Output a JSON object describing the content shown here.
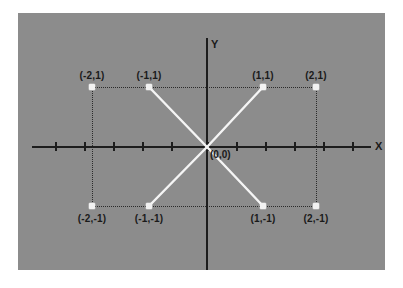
{
  "figure": {
    "background_color": "#ffffff",
    "panel_color": "#8c8c8c",
    "axis_color": "#1d1d1d",
    "point_color": "#f2f2f2",
    "line_color": "#f5f5f5",
    "guide_color": "#2b2b2b"
  },
  "axes": {
    "x_label": "X",
    "y_label": "Y",
    "origin_label": "(0,0)",
    "x_tick_count": 11,
    "x_axis_visible": true,
    "y_axis_visible": true,
    "grid": false
  },
  "chart_data": {
    "type": "scatter",
    "title": "",
    "xlabel": "X",
    "ylabel": "Y",
    "xlim": [
      -3,
      3
    ],
    "ylim": [
      -2.2,
      2.2
    ],
    "grid": false,
    "legend": "none",
    "points": [
      {
        "label": "(-2,1)",
        "x": -2,
        "y": 1,
        "px": 74,
        "py": 74,
        "label_px": 74,
        "label_py": 57,
        "label_pos": "above"
      },
      {
        "label": "(-1,1)",
        "x": -1,
        "y": 1,
        "px": 131,
        "py": 74,
        "label_px": 131,
        "label_py": 57,
        "label_pos": "above"
      },
      {
        "label": "(1,1)",
        "x": 1,
        "y": 1,
        "px": 245,
        "py": 74,
        "label_px": 245,
        "label_py": 57,
        "label_pos": "above"
      },
      {
        "label": "(2,1)",
        "x": 2,
        "y": 1,
        "px": 298,
        "py": 74,
        "label_px": 298,
        "label_py": 57,
        "label_pos": "above"
      },
      {
        "label": "(-2,-1)",
        "x": -2,
        "y": -1,
        "px": 74,
        "py": 193,
        "label_px": 74,
        "label_py": 200,
        "label_pos": "below"
      },
      {
        "label": "(-1,-1)",
        "x": -1,
        "y": -1,
        "px": 131,
        "py": 193,
        "label_px": 131,
        "label_py": 200,
        "label_pos": "below"
      },
      {
        "label": "(1,-1)",
        "x": 1,
        "y": -1,
        "px": 245,
        "py": 193,
        "label_px": 245,
        "label_py": 200,
        "label_pos": "below"
      },
      {
        "label": "(2,-1)",
        "x": 2,
        "y": -1,
        "px": 298,
        "py": 193,
        "label_px": 298,
        "label_py": 200,
        "label_pos": "below"
      }
    ],
    "segments": [
      {
        "name": "upper-left-to-origin",
        "from": "(-1,1)",
        "to": "(0,0)",
        "x1": 131,
        "y1": 74,
        "x2": 189,
        "y2": 134
      },
      {
        "name": "origin-to-lower-right",
        "from": "(0,0)",
        "to": "(1,-1)",
        "x1": 189,
        "y1": 134,
        "x2": 245,
        "y2": 193
      },
      {
        "name": "lower-left-to-origin",
        "from": "(-1,-1)",
        "to": "(0,0)",
        "x1": 131,
        "y1": 193,
        "x2": 189,
        "y2": 134
      },
      {
        "name": "origin-to-upper-right",
        "from": "(0,0)",
        "to": "(1,1)",
        "x1": 189,
        "y1": 134,
        "x2": 245,
        "y2": 74
      }
    ],
    "guides": [
      {
        "name": "guide-top",
        "orientation": "horizontal",
        "from": "(-2,1)",
        "to": "(2,1)"
      },
      {
        "name": "guide-bottom",
        "orientation": "horizontal",
        "from": "(-2,-1)",
        "to": "(2,-1)"
      },
      {
        "name": "guide-left",
        "orientation": "vertical",
        "from": "(-2,1)",
        "to": "(-2,-1)"
      },
      {
        "name": "guide-right",
        "orientation": "vertical",
        "from": "(2,1)",
        "to": "(2,-1)"
      }
    ],
    "x_ticks_px": [
      37,
      66,
      95,
      124,
      153,
      189,
      218,
      247,
      276,
      305,
      334
    ]
  }
}
